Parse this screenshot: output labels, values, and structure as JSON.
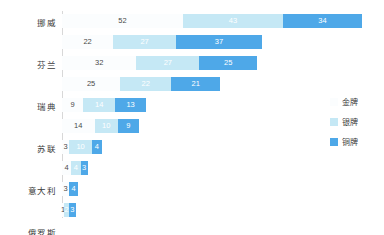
{
  "chart_data": {
    "type": "bar",
    "orientation": "horizontal",
    "stacked": true,
    "title": "",
    "subtitle": "",
    "xlabel": "",
    "ylabel": "",
    "grid": false,
    "legend_position": "right",
    "xlim": [
      0,
      129
    ],
    "categories": [
      "挪威",
      "芬兰",
      "瑞典",
      "苏联",
      "意大利",
      "俄罗斯",
      "德国",
      "ROC",
      "独联体",
      "捷克"
    ],
    "series": [
      {
        "name": "金牌",
        "color": "#fbfdfe",
        "values": [
          52,
          22,
          32,
          25,
          9,
          14,
          3,
          4,
          3,
          1
        ]
      },
      {
        "name": "银牌",
        "color": "#c5e8f5",
        "values": [
          43,
          27,
          27,
          22,
          14,
          10,
          10,
          4,
          0,
          2
        ]
      },
      {
        "name": "铜牌",
        "color": "#4ea8e8",
        "values": [
          34,
          37,
          25,
          21,
          13,
          9,
          4,
          3,
          4,
          3
        ]
      }
    ],
    "totals": [
      129,
      86,
      84,
      68,
      36,
      33,
      17,
      11,
      7,
      6
    ]
  },
  "legend": {
    "items": [
      {
        "label": "金牌",
        "color": "#fbfdfe"
      },
      {
        "label": "银牌",
        "color": "#c5e8f5"
      },
      {
        "label": "铜牌",
        "color": "#4ea8e8"
      }
    ]
  }
}
